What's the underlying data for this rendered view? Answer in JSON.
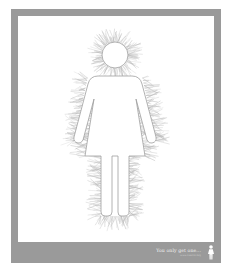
{
  "poster": {
    "frame_color": "#9a9a9a",
    "panel_color": "#ffffff",
    "figure": {
      "icon": "female-figure-icon",
      "fill": "#ffffff",
      "texture_color": "#b5b5b5"
    },
    "footer": {
      "tagline": "You only get one...",
      "subline": "www.cancer.org",
      "icon": "female-figure-icon"
    }
  }
}
